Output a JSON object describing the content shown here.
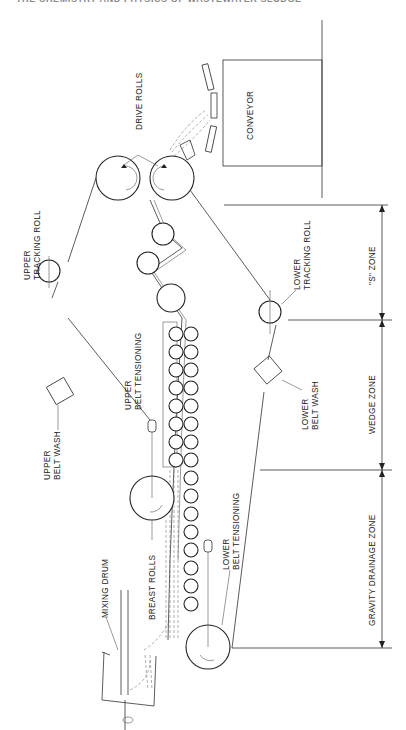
{
  "header": {
    "text": "THE CHEMISTRY AND PHYSICS OF WASTEWATER SLUDGE"
  },
  "diagram": {
    "orientation": "rotated 90deg (read with page turned)",
    "components": {
      "conveyor": "CONVEYOR",
      "drive_rolls": "DRIVE ROLLS",
      "upper_tracking_roll": [
        "UPPER",
        "TRACKING ROLL"
      ],
      "upper_belt_wash": [
        "UPPER",
        "BELT WASH"
      ],
      "upper_belt_tensioning": [
        "UPPER",
        "BELT TENSIONING"
      ],
      "lower_tracking_roll": [
        "LOWER",
        "TRACKING ROLL"
      ],
      "lower_belt_wash": [
        "LOWER",
        "BELT WASH"
      ],
      "lower_belt_tensioning": [
        "LOWER",
        "BELT TENSIONING"
      ],
      "breast_rolls": "BREAST ROLLS",
      "mixing_drum": "MIXING DRUM"
    },
    "zones": [
      {
        "label": "\"S\" ZONE"
      },
      {
        "label": "WEDGE ZONE"
      },
      {
        "label": "GRAVITY DRAINAGE ZONE"
      }
    ]
  }
}
